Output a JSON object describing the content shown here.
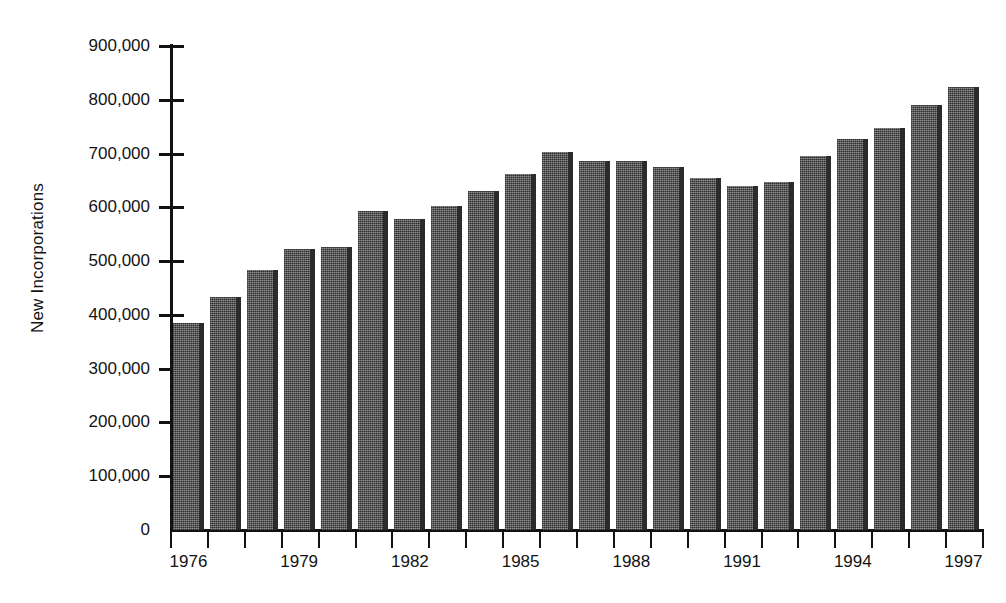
{
  "chart_data": {
    "type": "bar",
    "title": "",
    "subtitle": "",
    "xlabel": "",
    "ylabel": "New Incorporations",
    "ylim": [
      0,
      900000
    ],
    "ytick_values": [
      0,
      100000,
      200000,
      300000,
      400000,
      500000,
      600000,
      700000,
      800000,
      900000
    ],
    "ytick_labels": [
      "0",
      "100,000",
      "200,000",
      "300,000",
      "400,000",
      "500,000",
      "600,000",
      "700,000",
      "800,000",
      "900,000"
    ],
    "grid": false,
    "legend": null,
    "legend_position": "none",
    "xtick_labels_shown": [
      "1976",
      "1979",
      "1982",
      "1985",
      "1988",
      "1991",
      "1994",
      "1997"
    ],
    "categories": [
      "1976",
      "1977",
      "1978",
      "1979",
      "1980",
      "1981",
      "1982",
      "1983",
      "1984",
      "1985",
      "1986",
      "1987",
      "1988",
      "1989",
      "1990",
      "1991",
      "1992",
      "1993",
      "1994",
      "1995",
      "1996",
      "1997"
    ],
    "values": [
      385000,
      433000,
      483000,
      523000,
      527000,
      593000,
      578000,
      602000,
      630000,
      662000,
      702000,
      686000,
      686000,
      675000,
      655000,
      640000,
      648000,
      695000,
      727000,
      748000,
      790000,
      823000
    ],
    "bar_color": "#6a6a6a",
    "bar_edge_color": "#2b2b2b",
    "axis_color": "#121212",
    "background_color": "#ffffff"
  }
}
